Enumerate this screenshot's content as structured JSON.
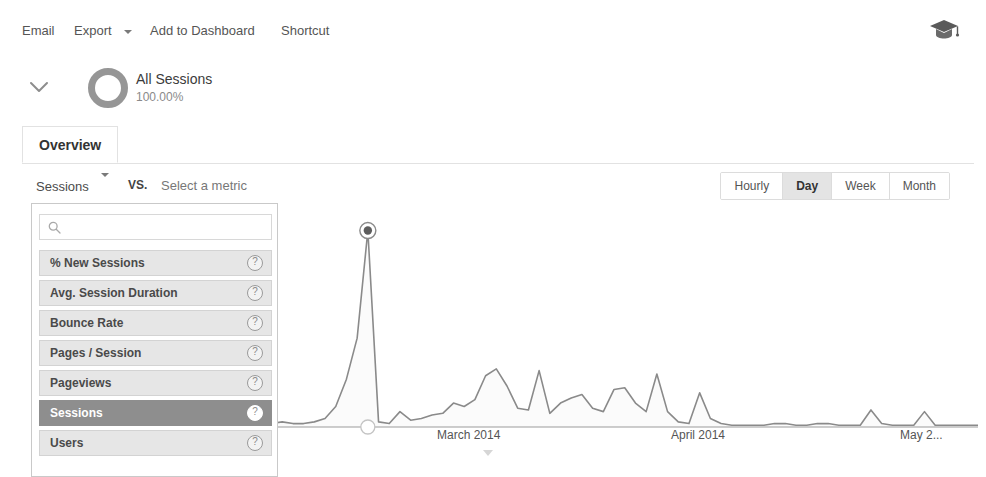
{
  "toolbar": {
    "email_label": "Email",
    "export_label": "Export",
    "export_caret_icon": "caret-down-icon",
    "add_to_dashboard_label": "Add to Dashboard",
    "shortcut_label": "Shortcut",
    "academy_icon": "graduation-cap-icon"
  },
  "segment": {
    "expander_icon": "chevron-down-icon",
    "donut_icon": "donut-chart-icon",
    "name": "All Sessions",
    "percent": "100.00%"
  },
  "tabs": [
    {
      "label": "Overview",
      "selected": true
    }
  ],
  "metric_selector": {
    "selected_metric": "Sessions",
    "caret_icon": "caret-down-icon",
    "vs_label": "VS.",
    "compare_placeholder": "Select a metric"
  },
  "metric_dropdown": {
    "search_icon": "search-icon",
    "search_value": "",
    "search_placeholder": "",
    "help_icon": "?",
    "items": [
      {
        "label": "% New Sessions",
        "selected": false
      },
      {
        "label": "Avg. Session Duration",
        "selected": false
      },
      {
        "label": "Bounce Rate",
        "selected": false
      },
      {
        "label": "Pages / Session",
        "selected": false
      },
      {
        "label": "Pageviews",
        "selected": false
      },
      {
        "label": "Sessions",
        "selected": true
      },
      {
        "label": "Users",
        "selected": false
      }
    ]
  },
  "granularity": {
    "options": [
      {
        "label": "Hourly",
        "selected": false
      },
      {
        "label": "Day",
        "selected": true
      },
      {
        "label": "Week",
        "selected": false
      },
      {
        "label": "Month",
        "selected": false
      }
    ]
  },
  "chart_data": {
    "type": "line",
    "title": "",
    "xlabel": "",
    "ylabel": "Sessions",
    "grid": false,
    "legend": null,
    "xtick_labels": [
      "2014",
      "March 2014",
      "April 2014",
      "May 2..."
    ],
    "xtick_positions": [
      245,
      437,
      671,
      900
    ],
    "ylim": [
      0,
      120
    ],
    "selected_point": {
      "x_label": "March 2014",
      "y": 115
    },
    "x": [
      0,
      1,
      2,
      3,
      4,
      5,
      6,
      7,
      8,
      9,
      10,
      11,
      12,
      13,
      14,
      15,
      16,
      17,
      18,
      19,
      20,
      21,
      22,
      23,
      24,
      25,
      26,
      27,
      28,
      29,
      30,
      31,
      32,
      33,
      34,
      35,
      36,
      37,
      38,
      39,
      40,
      41,
      42,
      43,
      44,
      45,
      46,
      47,
      48,
      49,
      50,
      51,
      52,
      53,
      54,
      55,
      56,
      57,
      58,
      59,
      60,
      61,
      62,
      63,
      64,
      65,
      66,
      67,
      68,
      69,
      70,
      71,
      72,
      73,
      74,
      75,
      76,
      77,
      78,
      79,
      80,
      81,
      82,
      83,
      84,
      85,
      86,
      87,
      88
    ],
    "values": [
      1,
      1,
      2,
      30,
      2,
      1,
      48,
      2,
      1,
      1,
      1,
      1,
      1,
      2,
      2,
      3,
      2,
      2,
      2,
      1,
      2,
      2,
      2,
      3,
      2,
      2,
      3,
      5,
      12,
      28,
      52,
      115,
      3,
      2,
      9,
      4,
      5,
      7,
      8,
      14,
      12,
      16,
      30,
      34,
      24,
      11,
      10,
      33,
      8,
      14,
      17,
      19,
      11,
      9,
      22,
      23,
      14,
      9,
      31,
      9,
      3,
      2,
      20,
      5,
      2,
      1,
      1,
      1,
      1,
      2,
      2,
      1,
      1,
      2,
      2,
      1,
      1,
      1,
      10,
      2,
      1,
      1,
      1,
      9,
      1,
      1,
      1,
      1,
      1
    ]
  }
}
